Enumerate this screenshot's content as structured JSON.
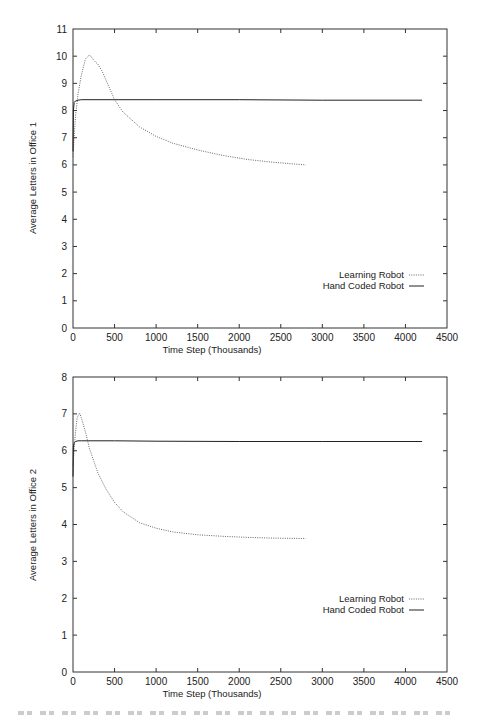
{
  "chart_data": [
    {
      "type": "line",
      "title": "",
      "xlabel": "Time Step (Thousands)",
      "ylabel": "Average Letters in Office 1",
      "xlim": [
        0,
        4500
      ],
      "ylim": [
        0,
        11
      ],
      "xticks": [
        0,
        500,
        1000,
        1500,
        2000,
        2500,
        3000,
        3500,
        4000,
        4500
      ],
      "yticks": [
        0,
        1,
        2,
        3,
        4,
        5,
        6,
        7,
        8,
        9,
        10,
        11
      ],
      "grid": false,
      "legend_position": "right-middle",
      "series": [
        {
          "name": "Learning Robot",
          "style": "dotted",
          "x": [
            0,
            10,
            30,
            60,
            100,
            150,
            200,
            250,
            300,
            350,
            400,
            500,
            600,
            800,
            1000,
            1200,
            1500,
            1800,
            2100,
            2400,
            2800
          ],
          "y": [
            6.3,
            6.8,
            7.8,
            8.6,
            9.3,
            9.9,
            10.05,
            9.85,
            9.7,
            9.45,
            9.1,
            8.4,
            7.95,
            7.4,
            7.05,
            6.8,
            6.55,
            6.35,
            6.2,
            6.1,
            6.0
          ]
        },
        {
          "name": "Hand Coded Robot",
          "style": "solid",
          "x": [
            0,
            5,
            15,
            30,
            60,
            100,
            500,
            1000,
            2000,
            3000,
            4200
          ],
          "y": [
            6.5,
            8.0,
            8.3,
            8.35,
            8.38,
            8.4,
            8.4,
            8.4,
            8.4,
            8.38,
            8.38
          ]
        }
      ]
    },
    {
      "type": "line",
      "title": "",
      "xlabel": "Time Step (Thousands)",
      "ylabel": "Average Letters in Office 2",
      "xlim": [
        0,
        4500
      ],
      "ylim": [
        0,
        8
      ],
      "xticks": [
        0,
        500,
        1000,
        1500,
        2000,
        2500,
        3000,
        3500,
        4000,
        4500
      ],
      "yticks": [
        0,
        1,
        2,
        3,
        4,
        5,
        6,
        7,
        8
      ],
      "grid": false,
      "legend_position": "right-middle",
      "series": [
        {
          "name": "Learning Robot",
          "style": "dotted",
          "x": [
            0,
            10,
            30,
            50,
            80,
            100,
            150,
            200,
            300,
            400,
            500,
            600,
            800,
            1000,
            1200,
            1500,
            1800,
            2100,
            2400,
            2800
          ],
          "y": [
            5.6,
            5.9,
            6.5,
            6.9,
            7.02,
            6.9,
            6.5,
            6.05,
            5.4,
            4.95,
            4.6,
            4.35,
            4.05,
            3.9,
            3.8,
            3.72,
            3.68,
            3.65,
            3.63,
            3.62
          ]
        },
        {
          "name": "Hand Coded Robot",
          "style": "solid",
          "x": [
            0,
            5,
            15,
            30,
            60,
            100,
            500,
            1000,
            2000,
            3000,
            4200
          ],
          "y": [
            5.3,
            6.1,
            6.22,
            6.25,
            6.27,
            6.27,
            6.27,
            6.26,
            6.25,
            6.25,
            6.25
          ]
        }
      ]
    }
  ],
  "plots": [
    {
      "ylabel": "Average Letters in Office 1",
      "xlabel": "Time Step (Thousands)",
      "legend": [
        "Learning Robot",
        "Hand Coded Robot"
      ]
    },
    {
      "ylabel": "Average Letters in Office 2",
      "xlabel": "Time Step (Thousands)",
      "legend": [
        "Learning Robot",
        "Hand Coded Robot"
      ]
    }
  ],
  "colors": {
    "axis": "#333333",
    "hand_coded": "#222222",
    "learning": "#555555",
    "background": "#ffffff"
  }
}
